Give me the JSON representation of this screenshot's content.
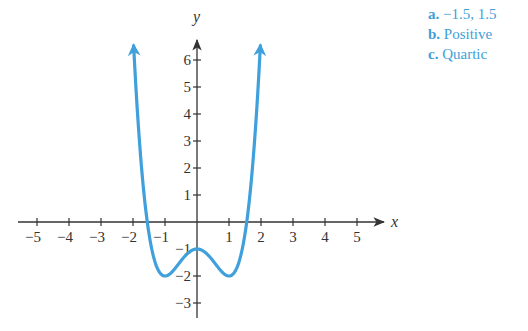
{
  "chart_data": {
    "type": "line",
    "title": "",
    "xlabel": "x",
    "ylabel": "y",
    "xlim": [
      -5,
      5
    ],
    "ylim": [
      -3,
      6
    ],
    "grid": false,
    "x_ticks": [
      -5,
      -4,
      -3,
      -2,
      -1,
      1,
      2,
      3,
      4,
      5
    ],
    "y_ticks": [
      -3,
      -2,
      -1,
      1,
      2,
      3,
      4,
      5,
      6
    ],
    "series": [
      {
        "name": "f(x) = x^4 - 2x^2 - 1",
        "color": "#3fa0db",
        "x": [
          -1.98,
          -1.75,
          -1.5,
          -1.25,
          -1.0,
          -0.75,
          -0.5,
          -0.25,
          0,
          0.25,
          0.5,
          0.75,
          1.0,
          1.25,
          1.5,
          1.75,
          1.98
        ],
        "y": [
          6.5,
          2.25,
          -0.44,
          -1.69,
          -2.0,
          -1.81,
          -1.44,
          -1.12,
          -1.0,
          -1.12,
          -1.44,
          -1.81,
          -2.0,
          -1.69,
          -0.44,
          2.25,
          6.5
        ],
        "end_arrows": true
      }
    ],
    "key_points": {
      "local_max": [
        0,
        -1
      ],
      "local_min": [
        [
          -1,
          -2
        ],
        [
          1,
          -2
        ]
      ],
      "x_intercepts_approx": [
        -1.5,
        1.5
      ]
    }
  },
  "answers": [
    {
      "key": "a.",
      "text": "−1.5, 1.5"
    },
    {
      "key": "b.",
      "text": "Positive"
    },
    {
      "key": "c.",
      "text": "Quartic"
    }
  ],
  "colors": {
    "curve": "#3fa0db",
    "axes": "#333333",
    "answers": "#3f9fd8"
  }
}
